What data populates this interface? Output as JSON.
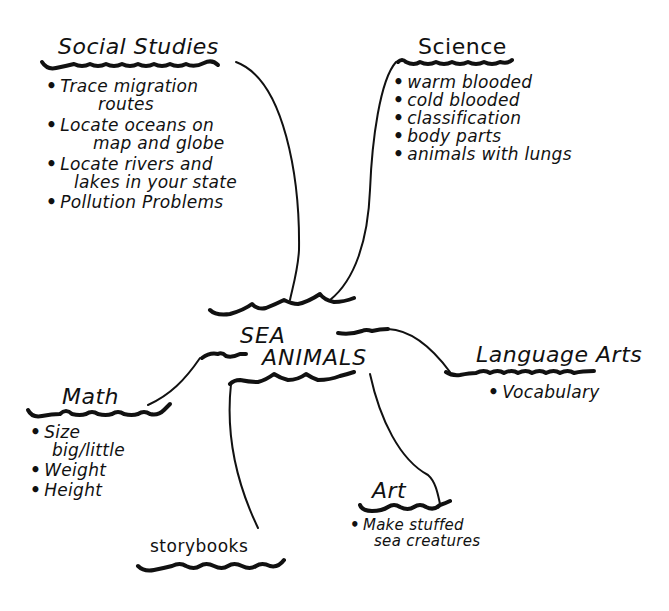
{
  "diagram": {
    "type": "web-concept-map",
    "center": {
      "line1": "SEA",
      "line2": "ANIMALS"
    },
    "nodes": {
      "social_studies": {
        "title": "Social Studies",
        "items": [
          {
            "line1": "Trace migration",
            "line2": "routes"
          },
          {
            "line1": "Locate oceans on",
            "line2": "map and globe"
          },
          {
            "line1": "Locate rivers and",
            "line2": "lakes in your state"
          },
          {
            "line1": "Pollution Problems",
            "line2": ""
          }
        ]
      },
      "science": {
        "title": "Science",
        "items": [
          "warm blooded",
          "cold blooded",
          "classification",
          "body parts",
          "animals with lungs"
        ]
      },
      "language_arts": {
        "title": "Language Arts",
        "items": [
          "Vocabulary"
        ]
      },
      "math": {
        "title": "Math",
        "items": [
          {
            "line1": "Size",
            "line2": "big/little"
          },
          {
            "line1": "Weight",
            "line2": ""
          },
          {
            "line1": "Height",
            "line2": ""
          }
        ]
      },
      "art": {
        "title": "Art",
        "items": [
          {
            "line1": "Make stuffed",
            "line2": "sea creatures"
          }
        ]
      },
      "storybooks": {
        "title": "Storybooks",
        "items": []
      }
    },
    "bullet": "•",
    "colors": {
      "ink": "#111111",
      "background": "#ffffff"
    }
  }
}
